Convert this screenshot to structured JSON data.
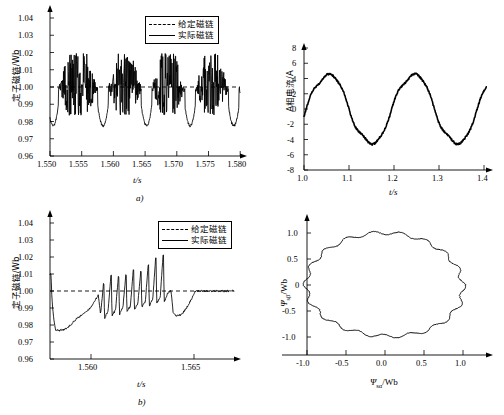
{
  "figure": {
    "background": "#ffffff",
    "line_color": "#000000",
    "panels": [
      "a)",
      "b)",
      "",
      ""
    ]
  },
  "panel_a": {
    "caption": "a)",
    "xlabel": "t/s",
    "ylabel": "定子磁链/Wb",
    "xticks": [
      "1.550",
      "1.555",
      "1.560",
      "1.565",
      "1.570",
      "1.575",
      "1.580"
    ],
    "yticks": [
      "0.96",
      "0.97",
      "0.98",
      "0.99",
      "1.00",
      "1.01",
      "1.02",
      "1.03",
      "1.04"
    ],
    "legend": [
      {
        "label": "给定磁链",
        "style": "dashed"
      },
      {
        "label": "实际磁链",
        "style": "solid"
      }
    ]
  },
  "panel_b": {
    "caption": "b)",
    "xlabel": "t/s",
    "ylabel": "定子磁链/Wb",
    "xticks": [
      "1.560",
      "1.565"
    ],
    "yticks": [
      "0.96",
      "0.97",
      "0.98",
      "0.99",
      "1.00",
      "1.01",
      "1.02",
      "1.03",
      "1.04"
    ],
    "legend": [
      {
        "label": "给定磁链",
        "style": "dashed"
      },
      {
        "label": "实际磁链",
        "style": "solid"
      }
    ]
  },
  "panel_c": {
    "caption": "",
    "xlabel": "t/s",
    "ylabel": "A相电流/A",
    "xticks": [
      "1.0",
      "1.1",
      "1.2",
      "1.3",
      "1.4"
    ],
    "yticks": [
      "-8",
      "-6",
      "-4",
      "-2",
      "0",
      "2",
      "4",
      "6",
      "8"
    ]
  },
  "panel_d": {
    "caption": "",
    "xlabel": "Ψsα/Wb",
    "xlabel_main": "Ψ",
    "xlabel_sub": "sα",
    "xlabel_unit": "/Wb",
    "ylabel_main": "Ψ",
    "ylabel_sub": "sβ",
    "ylabel_unit": "/Wb",
    "xticks": [
      "-1.0",
      "-0.5",
      "0.0",
      "0.5",
      "1.0"
    ],
    "yticks": [
      "-1.0",
      "-0.5",
      "0",
      "0.5",
      "1.0"
    ]
  },
  "chart_data": [
    {
      "id": "panel_a",
      "type": "line",
      "title": "",
      "xlabel": "t/s",
      "ylabel": "定子磁链/Wb",
      "xlim": [
        1.55,
        1.5805
      ],
      "ylim": [
        0.96,
        1.045
      ],
      "grid": false,
      "legend_position": "top-right",
      "series": [
        {
          "name": "给定磁链",
          "style": "dashed",
          "description": "Constant reference stator flux at 1.00 Wb spanning the full x range",
          "x": [
            1.55,
            1.5805
          ],
          "values": [
            1.0,
            1.0
          ]
        },
        {
          "name": "实际磁链",
          "style": "solid",
          "description": "High-frequency chattering actual stator flux oscillating in a band roughly 0.977 to 1.022 Wb about the 1.00 Wb reference, with five periodic deep dips to about 0.977-0.980 Wb near t = 1.5505, 1.5585, 1.5655, 1.5725 and 1.5795 s",
          "envelope_upper": 1.022,
          "envelope_lower": 0.977,
          "ripple_band": [
            0.985,
            1.018
          ],
          "dip_times": [
            1.5505,
            1.5585,
            1.5655,
            1.5725,
            1.5795
          ],
          "dip_value": 0.978,
          "mean": 1.0,
          "n_points": 620
        }
      ]
    },
    {
      "id": "panel_b",
      "type": "line",
      "title": "",
      "xlabel": "t/s",
      "ylabel": "定子磁链/Wb",
      "xlim": [
        1.5578,
        1.5668
      ],
      "ylim": [
        0.96,
        1.045
      ],
      "grid": false,
      "legend_position": "top-right",
      "series": [
        {
          "name": "给定磁链",
          "style": "dashed",
          "description": "Constant reference stator flux at 1.00 Wb",
          "x": [
            1.5578,
            1.5668
          ],
          "values": [
            1.0,
            1.0
          ]
        },
        {
          "name": "实际磁链",
          "style": "solid",
          "description": "Zoomed detail of the actual flux: starts near 1.010, falls to a flat trough about 0.977 between 1.5583 and 1.5592, ramps up with small steps, then a train of sawtooth bursts rising from about 0.986 up to peaks of 1.005, 1.010, 1.013, 1.016, 1.020, 1.022 before dropping back to a trough near 0.985 and recovering to 1.00",
          "trough_value": 0.977,
          "peak_values": [
            1.005,
            1.01,
            1.009,
            1.01,
            1.013,
            1.012,
            1.016,
            1.02,
            1.022
          ],
          "n_points": 420
        }
      ]
    },
    {
      "id": "panel_c",
      "type": "line",
      "title": "",
      "xlabel": "t/s",
      "ylabel": "A相电流/A",
      "xlim": [
        1.0,
        1.405
      ],
      "ylim": [
        -8,
        8
      ],
      "grid": false,
      "series": [
        {
          "name": "A相电流",
          "style": "solid",
          "description": "Near-sinusoidal A-phase current with small switching ripple; amplitude about 4.6 A, period about 0.19 s, starting near 0.4 A at t = 1.0 s",
          "amplitude": 4.6,
          "period": 0.19,
          "phase_start_value": 0.4,
          "peaks": [
            {
              "t": 1.052,
              "a": 4.6
            },
            {
              "t": 1.242,
              "a": 4.4
            }
          ],
          "troughs": [
            {
              "t": 1.147,
              "a": -4.7
            },
            {
              "t": 1.337,
              "a": -4.7
            }
          ],
          "ripple": 0.25
        }
      ]
    },
    {
      "id": "panel_d",
      "type": "line",
      "title": "",
      "xlabel": "Ψsα/Wb",
      "ylabel": "Ψsβ/Wb",
      "xlim": [
        -1.25,
        1.35
      ],
      "ylim": [
        -1.25,
        1.3
      ],
      "grid": false,
      "series": [
        {
          "name": "定子磁链轨迹",
          "style": "solid",
          "description": "Closed stator-flux trajectory in the alpha-beta plane: a slightly polygonal, near-circular locus of radius about 1.0 Wb centred at the origin, with a small opening/seam on the right side near (1.0, 0)",
          "radius": 1.0,
          "radius_variation": [
            0.93,
            1.05
          ],
          "n_sides": 18,
          "seam_point": [
            1.0,
            0.0
          ]
        }
      ]
    }
  ]
}
